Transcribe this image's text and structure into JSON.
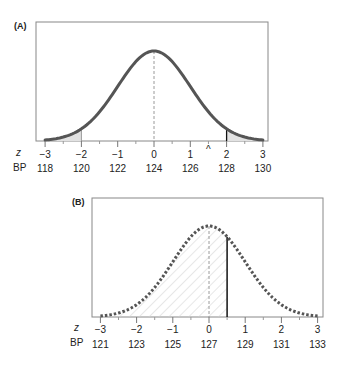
{
  "chart_data": [
    {
      "type": "area",
      "panel_label": "(A)",
      "title": "",
      "description": "Standard normal curve with both tails beyond z = ±2 shaded",
      "distribution": {
        "mean_bp": 124,
        "sd_bp": 2
      },
      "curve_style": "solid",
      "x_axes": [
        {
          "name": "z",
          "ticks": [
            "−3",
            "−2",
            "−1",
            "0",
            "1",
            "2",
            "3"
          ],
          "values": [
            -3,
            -2,
            -1,
            0,
            1,
            2,
            3
          ]
        },
        {
          "name": "BP",
          "ticks": [
            "118",
            "120",
            "122",
            "124",
            "126",
            "128",
            "130"
          ],
          "values": [
            118,
            120,
            122,
            124,
            126,
            128,
            130
          ]
        }
      ],
      "shaded_regions": [
        {
          "from_z": -3,
          "to_z": -2
        },
        {
          "from_z": 2,
          "to_z": 3
        }
      ],
      "mean_line_z": 0,
      "marker": {
        "symbol": "^",
        "z": 1.5
      },
      "grid": false,
      "legend": null
    },
    {
      "type": "area",
      "panel_label": "(B)",
      "title": "",
      "description": "Normal curve (dotted) with hatched area left of z ≈ 0.5 (BP 128)",
      "distribution": {
        "mean_bp": 127,
        "sd_bp": 2
      },
      "curve_style": "dotted",
      "x_axes": [
        {
          "name": "z",
          "ticks": [
            "−3",
            "−2",
            "−1",
            "0",
            "1",
            "2",
            "3"
          ],
          "values": [
            -3,
            -2,
            -1,
            0,
            1,
            2,
            3
          ]
        },
        {
          "name": "BP",
          "ticks": [
            "121",
            "123",
            "125",
            "127",
            "129",
            "131",
            "133"
          ],
          "values": [
            121,
            123,
            125,
            127,
            129,
            131,
            133
          ]
        }
      ],
      "shaded_regions": [
        {
          "from_z": -3,
          "to_z": 0.5,
          "style": "hatched"
        }
      ],
      "cutoff_line": {
        "z": 0.5,
        "bp": 128
      },
      "mean_line_z": 0,
      "grid": false,
      "legend": null
    }
  ],
  "colors": {
    "curve": "#555555",
    "frame": "#888888",
    "tail_fill": "#e2e2e2",
    "hatch": "#cfcfcf",
    "cutoff": "#111111",
    "mean_dash": "#9a9a9a"
  }
}
